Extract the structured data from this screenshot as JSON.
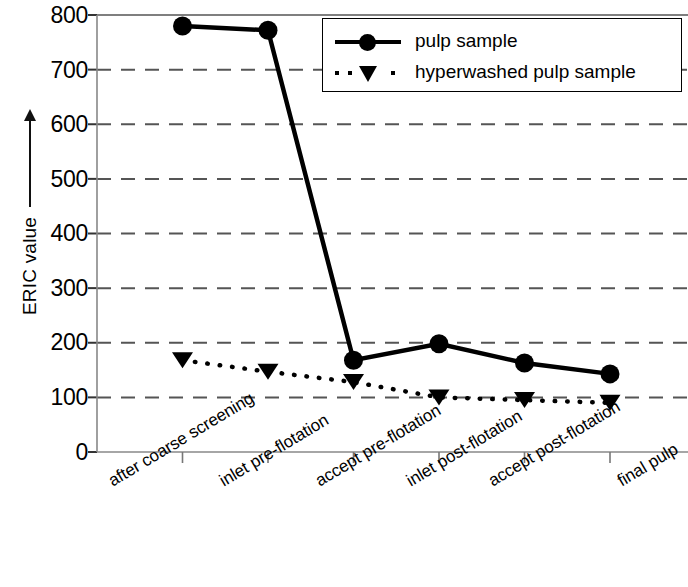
{
  "chart_data": {
    "type": "line",
    "title": "",
    "xlabel": "",
    "ylabel": "ERIC value",
    "ylabel_arrow": "↑",
    "categories": [
      "after coarse screening",
      "inlet pre-flotation",
      "accept pre-flotation",
      "inlet post-flotation",
      "accept post-flotation",
      "final pulp"
    ],
    "series": [
      {
        "name": "pulp sample",
        "marker": "circle",
        "line_style": "solid",
        "color": "#000000",
        "values": [
          780,
          772,
          168,
          198,
          163,
          143
        ]
      },
      {
        "name": "hyperwashed pulp sample",
        "marker": "triangle-down",
        "line_style": "dotted",
        "color": "#000000",
        "values": [
          168,
          147,
          128,
          100,
          95,
          90
        ]
      }
    ],
    "ylim": [
      0,
      800
    ],
    "y_ticks": [
      0,
      100,
      200,
      300,
      400,
      500,
      600,
      700,
      800
    ],
    "y_tick_labels": [
      "0",
      "100",
      "200",
      "300",
      "400",
      "500",
      "600",
      "700",
      "800"
    ],
    "grid": true,
    "grid_style": "dashed-horizontal",
    "legend_position": "top-right",
    "legend_entries": [
      "pulp sample",
      "hyperwashed pulp sample"
    ]
  }
}
